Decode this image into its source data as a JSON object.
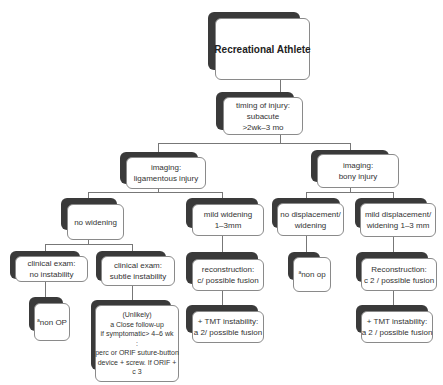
{
  "title": "Recreational Athlete",
  "nodes": {
    "root": {
      "lines": [
        "Recreational Athlete"
      ]
    },
    "timing": {
      "lines": [
        "timing of injury:",
        "subacute",
        ">2wk–3 mo"
      ]
    },
    "imaging_lig": {
      "lines": [
        "imaging:",
        "ligamentous injury"
      ]
    },
    "imaging_bony": {
      "lines": [
        "imaging:",
        "bony injury"
      ]
    },
    "no_widening": {
      "lines": [
        "no widening"
      ]
    },
    "mild_widening": {
      "lines": [
        "mild widening",
        "1–3mm"
      ]
    },
    "no_displacement": {
      "lines": [
        "no displacement/",
        "widening"
      ]
    },
    "mild_displacement": {
      "lines": [
        "mild displacement/",
        "widening 1–3 mm"
      ]
    },
    "clin_no_instab": {
      "lines": [
        "clinical exam:",
        "no instability"
      ]
    },
    "clin_subtle": {
      "lines": [
        "clinical exam:",
        "subtle instability"
      ]
    },
    "recon_lig": {
      "lines": [
        "reconstruction:",
        "c/  possible fusion"
      ]
    },
    "nonop_bony": {
      "sup": "a",
      "text": "non op"
    },
    "recon_bony": {
      "lines": [
        "Reconstruction:",
        "c 2 / possible fusion"
      ]
    },
    "nonop_lig": {
      "sup": "a",
      "text": "non OP"
    },
    "unlikely": {
      "lines": [
        "(Unlikely)",
        "a Close follow-up",
        "if symptomatic> 4–6 wk",
        ":",
        "perc or ORIF suture-button",
        "device + screw.  If ORIF +",
        "c 3"
      ]
    },
    "tmt_lig": {
      "lines": [
        "+ TMT instability:",
        "a 2/ possible fusion"
      ]
    },
    "tmt_bony": {
      "lines": [
        "+ TMT instability:",
        "a 2 / possible fusion"
      ]
    }
  },
  "colors": {
    "shadow": "#3a3a3a",
    "border": "#8a8a8a",
    "line": "#777777",
    "background": "#ffffff"
  }
}
